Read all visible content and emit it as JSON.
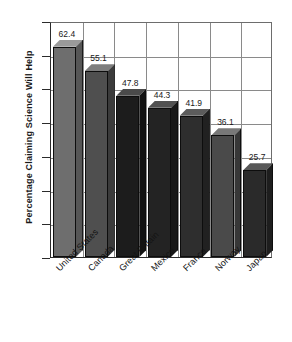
{
  "chart_data": {
    "type": "bar",
    "title": "",
    "subtitle": "",
    "xlabel": "",
    "ylabel": "Percentage  Claiming Science Will Help",
    "categories": [
      "United States",
      "Canada",
      "Great Britain",
      "Mexico",
      "France",
      "Norway",
      "Japan"
    ],
    "values": [
      62.4,
      55.1,
      47.8,
      44.3,
      41.9,
      36.1,
      25.7
    ],
    "value_labels": [
      "62.4",
      "55.1",
      "47.8",
      "44.3",
      "41.9",
      "36.1",
      "25.7"
    ],
    "ylim": [
      0,
      70
    ],
    "ytick_labels": [
      "0",
      "10",
      "20",
      "30",
      "40",
      "50",
      "60",
      "70"
    ],
    "ytick_values": [
      0,
      10,
      20,
      30,
      40,
      50,
      60,
      70
    ],
    "grid": "both",
    "legend": "none",
    "style": "3d-bar",
    "bar_colors": [
      "#6e6e6e",
      "#4f4f4f",
      "#1c1c1c",
      "#232323",
      "#2e2e2e",
      "#4a4a4a",
      "#2a2a2a"
    ],
    "bar_top_colors": [
      "#9a9a9a",
      "#7d7d7d",
      "#4a4a4a",
      "#515151",
      "#5c5c5c",
      "#787878",
      "#585858"
    ],
    "bar_side_colors": [
      "#565656",
      "#3b3b3b",
      "#121212",
      "#181818",
      "#212121",
      "#373737",
      "#1e1e1e"
    ],
    "axis_color": "#2b2b2b",
    "grid_color": "#8a8a8a",
    "background": "#ffffff"
  }
}
